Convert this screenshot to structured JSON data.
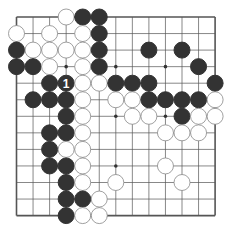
{
  "diagram": {
    "type": "go-board",
    "size": 13,
    "star_points": [
      [
        3,
        3
      ],
      [
        3,
        6
      ],
      [
        3,
        9
      ],
      [
        6,
        3
      ],
      [
        6,
        6
      ],
      [
        6,
        9
      ],
      [
        9,
        3
      ],
      [
        9,
        6
      ],
      [
        9,
        9
      ]
    ],
    "colors": {
      "background": "#ffffff",
      "line": "#555555",
      "black": "#333333",
      "white_fill": "#ffffff",
      "white_edge": "#888888",
      "label_on_black": "#ffffff"
    },
    "stones": [
      {
        "r": 0,
        "c": 3,
        "color": "white"
      },
      {
        "r": 0,
        "c": 4,
        "color": "black"
      },
      {
        "r": 0,
        "c": 5,
        "color": "black"
      },
      {
        "r": 1,
        "c": 0,
        "color": "white"
      },
      {
        "r": 1,
        "c": 2,
        "color": "white"
      },
      {
        "r": 1,
        "c": 4,
        "color": "white"
      },
      {
        "r": 1,
        "c": 5,
        "color": "black"
      },
      {
        "r": 2,
        "c": 0,
        "color": "black"
      },
      {
        "r": 2,
        "c": 1,
        "color": "white"
      },
      {
        "r": 2,
        "c": 2,
        "color": "white"
      },
      {
        "r": 2,
        "c": 3,
        "color": "white"
      },
      {
        "r": 2,
        "c": 4,
        "color": "white"
      },
      {
        "r": 2,
        "c": 5,
        "color": "black"
      },
      {
        "r": 2,
        "c": 8,
        "color": "black"
      },
      {
        "r": 2,
        "c": 10,
        "color": "black"
      },
      {
        "r": 3,
        "c": 0,
        "color": "black"
      },
      {
        "r": 3,
        "c": 1,
        "color": "black"
      },
      {
        "r": 3,
        "c": 2,
        "color": "white"
      },
      {
        "r": 3,
        "c": 4,
        "color": "white"
      },
      {
        "r": 3,
        "c": 5,
        "color": "black"
      },
      {
        "r": 3,
        "c": 11,
        "color": "black"
      },
      {
        "r": 4,
        "c": 2,
        "color": "black"
      },
      {
        "r": 4,
        "c": 3,
        "color": "black",
        "label": "1"
      },
      {
        "r": 4,
        "c": 4,
        "color": "white"
      },
      {
        "r": 4,
        "c": 5,
        "color": "white"
      },
      {
        "r": 4,
        "c": 6,
        "color": "black"
      },
      {
        "r": 4,
        "c": 7,
        "color": "black"
      },
      {
        "r": 4,
        "c": 8,
        "color": "black"
      },
      {
        "r": 4,
        "c": 12,
        "color": "black"
      },
      {
        "r": 5,
        "c": 1,
        "color": "black"
      },
      {
        "r": 5,
        "c": 2,
        "color": "black"
      },
      {
        "r": 5,
        "c": 3,
        "color": "black"
      },
      {
        "r": 5,
        "c": 4,
        "color": "white"
      },
      {
        "r": 5,
        "c": 6,
        "color": "white"
      },
      {
        "r": 5,
        "c": 7,
        "color": "white"
      },
      {
        "r": 5,
        "c": 8,
        "color": "black"
      },
      {
        "r": 5,
        "c": 9,
        "color": "black"
      },
      {
        "r": 5,
        "c": 10,
        "color": "black"
      },
      {
        "r": 5,
        "c": 11,
        "color": "black"
      },
      {
        "r": 5,
        "c": 12,
        "color": "white"
      },
      {
        "r": 6,
        "c": 3,
        "color": "black"
      },
      {
        "r": 6,
        "c": 4,
        "color": "white"
      },
      {
        "r": 6,
        "c": 7,
        "color": "white"
      },
      {
        "r": 6,
        "c": 8,
        "color": "white"
      },
      {
        "r": 6,
        "c": 10,
        "color": "black"
      },
      {
        "r": 6,
        "c": 11,
        "color": "white"
      },
      {
        "r": 6,
        "c": 12,
        "color": "white"
      },
      {
        "r": 7,
        "c": 2,
        "color": "black"
      },
      {
        "r": 7,
        "c": 3,
        "color": "black"
      },
      {
        "r": 7,
        "c": 4,
        "color": "white"
      },
      {
        "r": 7,
        "c": 9,
        "color": "white"
      },
      {
        "r": 7,
        "c": 10,
        "color": "white"
      },
      {
        "r": 7,
        "c": 11,
        "color": "white"
      },
      {
        "r": 8,
        "c": 2,
        "color": "black"
      },
      {
        "r": 8,
        "c": 3,
        "color": "white"
      },
      {
        "r": 8,
        "c": 4,
        "color": "white"
      },
      {
        "r": 9,
        "c": 2,
        "color": "black"
      },
      {
        "r": 9,
        "c": 3,
        "color": "black"
      },
      {
        "r": 9,
        "c": 4,
        "color": "white"
      },
      {
        "r": 9,
        "c": 9,
        "color": "white"
      },
      {
        "r": 10,
        "c": 3,
        "color": "black"
      },
      {
        "r": 10,
        "c": 4,
        "color": "white"
      },
      {
        "r": 10,
        "c": 6,
        "color": "white"
      },
      {
        "r": 10,
        "c": 10,
        "color": "white"
      },
      {
        "r": 11,
        "c": 3,
        "color": "black"
      },
      {
        "r": 11,
        "c": 4,
        "color": "black"
      },
      {
        "r": 11,
        "c": 5,
        "color": "white"
      },
      {
        "r": 12,
        "c": 3,
        "color": "black"
      },
      {
        "r": 12,
        "c": 4,
        "color": "white"
      },
      {
        "r": 12,
        "c": 5,
        "color": "white"
      }
    ]
  }
}
